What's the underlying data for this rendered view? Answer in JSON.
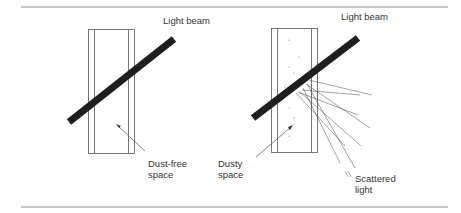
{
  "figure": {
    "left_panel": {
      "beam_label": "Light beam",
      "space_label": "Dust-free\nspace"
    },
    "right_panel": {
      "beam_label": "Light beam",
      "space_label": "Dusty\nspace",
      "scatter_label": "Scattered\nlight"
    }
  },
  "colors": {
    "rule": "#8a8a8a",
    "outline": "#555555",
    "beam": "#1e1e1e",
    "text": "#333333"
  }
}
